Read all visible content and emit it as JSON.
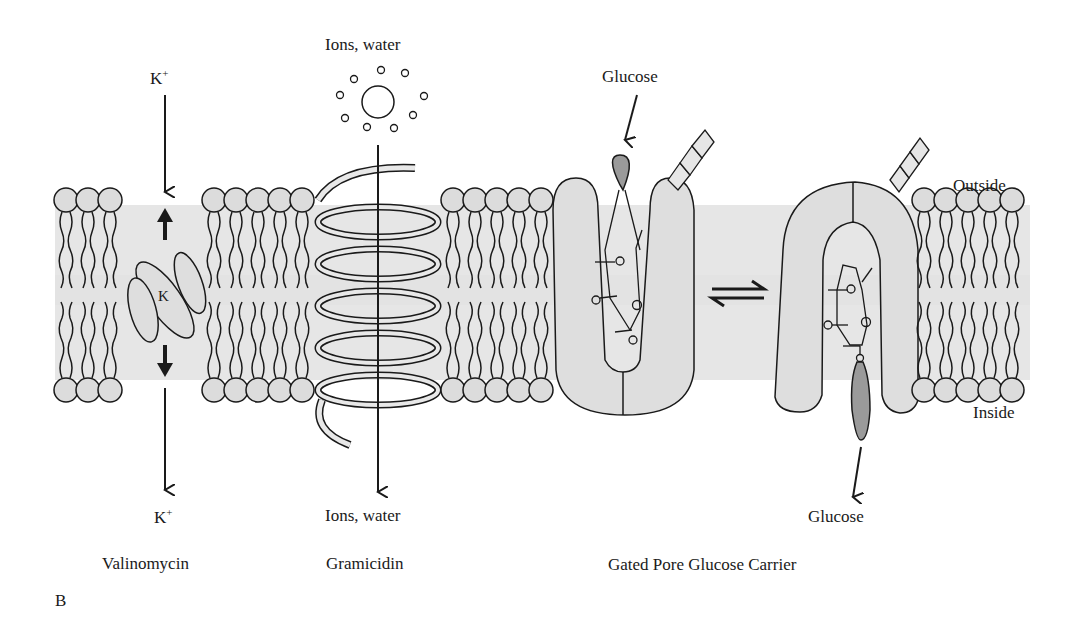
{
  "figure": {
    "panel_label": "B",
    "colors": {
      "membrane_band": "#e6e6e6",
      "head_fill": "#dcdcdc",
      "protein_fill": "#dedede",
      "glucose_fill": "#9a9a9a",
      "line": "#1a1a1a",
      "background": "#ffffff"
    },
    "side_labels": {
      "outside": "Outside",
      "inside": "Inside"
    },
    "valinomycin": {
      "top_ion": "K",
      "top_ion_charge": "+",
      "complex_label": "K",
      "bottom_ion": "K",
      "bottom_ion_charge": "+",
      "caption": "Valinomycin"
    },
    "gramicidin": {
      "top_label": "Ions, water",
      "bottom_label": "Ions, water",
      "caption": "Gramicidin"
    },
    "glucose_carrier": {
      "glucose_in_label": "Glucose",
      "glucose_out_label": "Glucose",
      "equilibrium_symbol": "⇌",
      "caption": "Gated Pore Glucose Carrier"
    }
  }
}
